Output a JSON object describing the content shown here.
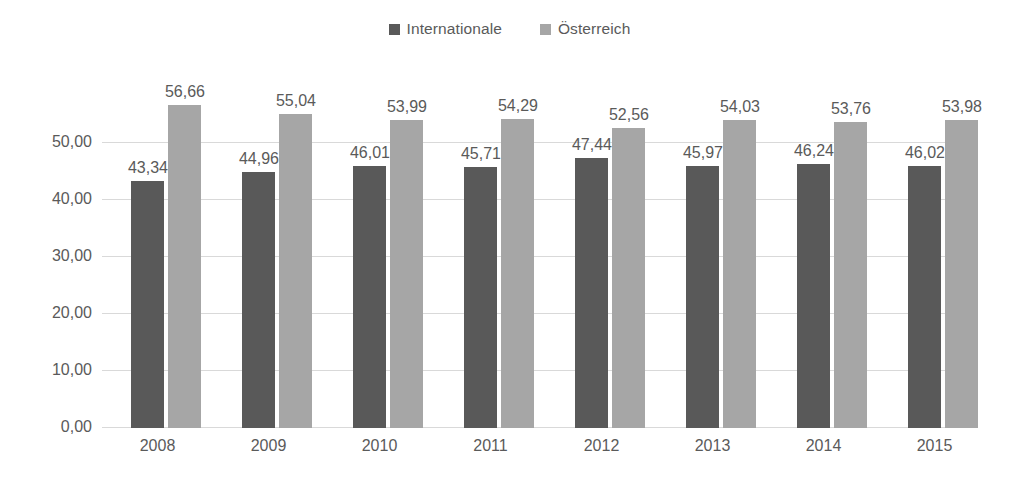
{
  "chart_data": {
    "type": "bar",
    "title": "",
    "subtitle": "",
    "xlabel": "",
    "ylabel": "",
    "categories": [
      "2008",
      "2009",
      "2010",
      "2011",
      "2012",
      "2013",
      "2014",
      "2015"
    ],
    "series": [
      {
        "name": "Internationale",
        "color": "#595959",
        "values": [
          43.34,
          44.96,
          46.01,
          45.71,
          47.44,
          45.97,
          46.24,
          46.02
        ],
        "labels": [
          "43,34",
          "44,96",
          "46,01",
          "45,71",
          "47,44",
          "45,97",
          "46,24",
          "46,02"
        ]
      },
      {
        "name": "Österreich",
        "color": "#a6a6a6",
        "values": [
          56.66,
          55.04,
          53.99,
          54.29,
          52.56,
          54.03,
          53.76,
          53.98
        ],
        "labels": [
          "56,66",
          "55,04",
          "53,99",
          "54,29",
          "52,56",
          "54,03",
          "53,76",
          "53,98"
        ]
      }
    ],
    "ylim": [
      0,
      50
    ],
    "ymax_plot": 60,
    "yticks": [
      0,
      10,
      20,
      30,
      40,
      50
    ],
    "ytick_labels": [
      "0,00",
      "10,00",
      "20,00",
      "30,00",
      "40,00",
      "50,00"
    ],
    "grid": true,
    "grid_color": "#d9d9d9",
    "legend_position": "top-center",
    "data_labels": true,
    "background": "#ffffff",
    "text_color": "#595959"
  }
}
